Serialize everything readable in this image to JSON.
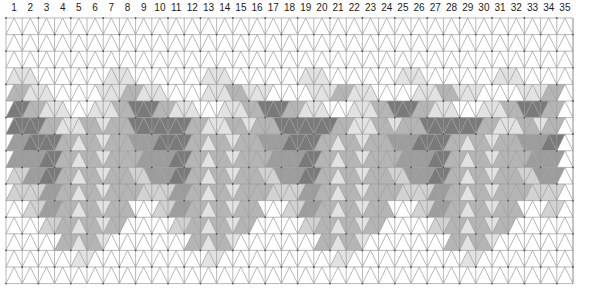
{
  "chart_data": {
    "type": "heatmap",
    "title": "",
    "subtitle": "",
    "xlabel": "",
    "ylabel": "",
    "grid": true,
    "legend_position": "none",
    "geometry": {
      "lattice": "triangular-isometric",
      "columns": 35,
      "rows": 16,
      "cell_width": 16.2,
      "row_height": 16.6,
      "origin_x": 6,
      "origin_y": 18,
      "triangles_per_row": 70,
      "description": "Isometric triangle grid; each row alternates upward and downward pointing triangles. Shading forms a repeating row of linked isometric cubes / hexagonal rings."
    },
    "x_tick_labels": [
      "1",
      "2",
      "3",
      "4",
      "5",
      "6",
      "7",
      "8",
      "9",
      "10",
      "11",
      "12",
      "13",
      "14",
      "15",
      "16",
      "17",
      "18",
      "19",
      "20",
      "21",
      "22",
      "23",
      "24",
      "25",
      "26",
      "27",
      "28",
      "29",
      "30",
      "31",
      "32",
      "33",
      "34",
      "35"
    ],
    "palette": {
      "white": "#ffffff",
      "light": "#e2e2e2",
      "light2": "#d2d2d2",
      "medium": "#b5b5b5",
      "medium2": "#9d9d9d",
      "dark": "#7a7a7a",
      "darker": "#5e5e5e",
      "grid_line": "#9a9a9a",
      "label_color": "#1a1a1a"
    },
    "legend_entries": [
      {
        "label": "white",
        "color": "#ffffff"
      },
      {
        "label": "light grey",
        "color": "#e2e2e2"
      },
      {
        "label": "mid grey",
        "color": "#b5b5b5"
      },
      {
        "label": "dark grey",
        "color": "#7a7a7a"
      },
      {
        "label": "darkest grey",
        "color": "#5e5e5e"
      }
    ],
    "rows": [
      "00000000000000000000000000000000000000000000000000000000000000000000",
      "00000000000000000000000000000000000000000000000000000000000000000000",
      "00000000000000000000000000000000000000000000000000000000000000000000",
      "11100000000011100000000011100000000011100000000011100000000011100000",
      "33111000000111331110000011133111000001113311100000111331110000011133",
      "55331110001113355533111000111335553311100011133555331110001113355533",
      "55553311133133355555553311133133355555553311133133355555553311133133",
      "44555533133133344455553313313334445555331331333444555533133133344455",
      "44445533133133334444553313313333444455331331333344445533133133334444",
      "22445533133133322444553313313332244455331331333224445533133133322444",
      "22224433133133332222443313313333222244331331333322224433133133332222",
      "00224433133133300022443313313330002244331331333000224433133133300022",
      "00002233133133000000223313313300000022331331330000002233133133000000",
      "00000033133100000000003313310000000000331331000000000033133100000000",
      "00000000110000000000000011000000000000001100000000000000110000000000",
      "00000000000000000000000000000000000000000000000000000000000000000000"
    ]
  }
}
